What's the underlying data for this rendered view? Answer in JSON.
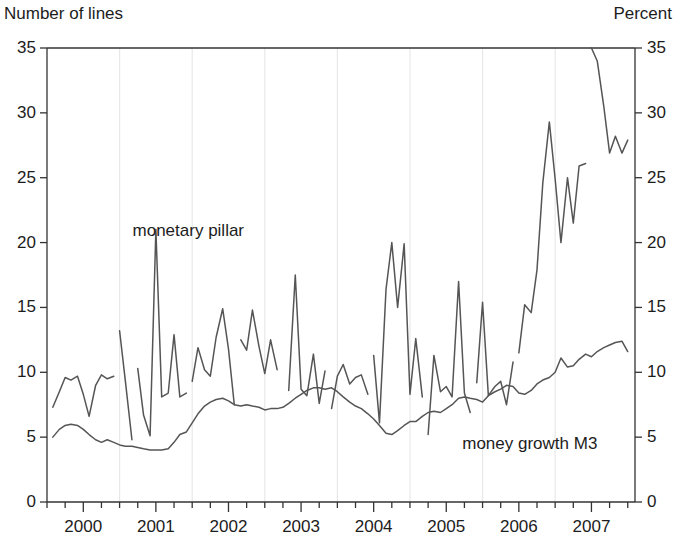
{
  "chart_data": {
    "type": "line",
    "title": "",
    "subtitle": "",
    "left_axis_title": "Number of lines",
    "right_axis_title": "Percent",
    "xlabel": "",
    "ylabel": "Number of lines",
    "ylabel_right": "Percent",
    "ylim": [
      0,
      35
    ],
    "y_ticks": [
      0,
      5,
      10,
      15,
      20,
      25,
      30,
      35
    ],
    "y_ticks_right": [
      0,
      5,
      10,
      15,
      20,
      25,
      30,
      35
    ],
    "xlim": [
      1999.5,
      2007.6
    ],
    "x_tick_labels": [
      "2000",
      "2001",
      "2002",
      "2003",
      "2004",
      "2005",
      "2006",
      "2007"
    ],
    "x_tick_positions": [
      2000.0,
      2001.0,
      2002.0,
      2003.0,
      2004.0,
      2005.0,
      2006.0,
      2007.0
    ],
    "x_minor_tick_interval": 0.25,
    "grid": "vertical-only-faint",
    "gridline_positions": [
      2000.5,
      2001.5,
      2002.5,
      2003.5,
      2004.5,
      2005.5,
      2006.5
    ],
    "legend": "inline-annotations",
    "line_color": "#555555",
    "axis_color": "#333333",
    "gridline_color": "#e8e8e8",
    "annotations": [
      {
        "text": "monetary pillar",
        "x": 2001.45,
        "y": 20.9
      },
      {
        "text": "money growth M3",
        "x": 2006.15,
        "y": 4.5
      }
    ],
    "series": [
      {
        "name": "monetary pillar",
        "axis": "left",
        "units": "number of lines",
        "segments": [
          {
            "x": [
              1999.58,
              1999.67,
              1999.75,
              1999.83,
              1999.92,
              2000.0,
              2000.08,
              2000.17,
              2000.25,
              2000.33,
              2000.42
            ],
            "y": [
              7.3,
              8.5,
              9.6,
              9.4,
              9.7,
              8.3,
              6.6,
              9.0,
              9.8,
              9.5,
              9.7
            ]
          },
          {
            "x": [
              2000.5,
              2000.58,
              2000.67
            ],
            "y": [
              13.2,
              9.3,
              4.8
            ]
          },
          {
            "x": [
              2000.75,
              2000.83,
              2000.92,
              2001.0,
              2001.08,
              2001.17,
              2001.25,
              2001.33,
              2001.42
            ],
            "y": [
              10.3,
              6.7,
              5.1,
              21.0,
              8.1,
              8.4,
              12.9,
              8.1,
              8.4
            ]
          },
          {
            "x": [
              2001.5,
              2001.58,
              2001.67,
              2001.75,
              2001.83,
              2001.92,
              2002.0,
              2002.08
            ],
            "y": [
              9.3,
              11.9,
              10.2,
              9.7,
              12.7,
              14.9,
              11.8,
              7.5
            ]
          },
          {
            "x": [
              2002.17,
              2002.25,
              2002.33,
              2002.42,
              2002.5,
              2002.58,
              2002.67
            ],
            "y": [
              12.5,
              11.7,
              14.8,
              12.0,
              9.9,
              12.5,
              10.2
            ]
          },
          {
            "x": [
              2002.83,
              2002.92,
              2003.0,
              2003.08,
              2003.17,
              2003.25,
              2003.33
            ],
            "y": [
              8.6,
              17.5,
              8.7,
              8.2,
              11.4,
              7.6,
              10.1
            ]
          },
          {
            "x": [
              2003.42,
              2003.5,
              2003.58,
              2003.67,
              2003.75,
              2003.83,
              2003.92
            ],
            "y": [
              7.2,
              9.7,
              10.6,
              9.1,
              9.6,
              9.8,
              8.3
            ]
          },
          {
            "x": [
              2004.0,
              2004.08,
              2004.17,
              2004.25,
              2004.33,
              2004.42,
              2004.5,
              2004.58,
              2004.67
            ],
            "y": [
              11.3,
              6.1,
              16.4,
              20.0,
              15.0,
              19.9,
              8.3,
              12.6,
              8.1
            ]
          },
          {
            "x": [
              2004.75,
              2004.83,
              2004.92,
              2005.0,
              2005.08,
              2005.17,
              2005.25,
              2005.33
            ],
            "y": [
              5.2,
              11.3,
              8.5,
              8.9,
              8.1,
              17.0,
              8.4,
              6.9
            ]
          },
          {
            "x": [
              2005.42,
              2005.5,
              2005.58,
              2005.67,
              2005.75,
              2005.83,
              2005.92
            ],
            "y": [
              9.2,
              15.4,
              8.2,
              8.9,
              9.3,
              7.5,
              10.8
            ]
          },
          {
            "x": [
              2006.0,
              2006.08,
              2006.17,
              2006.25,
              2006.33,
              2006.42,
              2006.5,
              2006.58,
              2006.67,
              2006.75,
              2006.83,
              2006.92
            ],
            "y": [
              11.5,
              15.2,
              14.6,
              17.9,
              24.6,
              29.3,
              24.9,
              20.0,
              25.0,
              21.5,
              25.9,
              26.1
            ]
          },
          {
            "x": [
              2007.0,
              2007.08,
              2007.17,
              2007.25,
              2007.33,
              2007.42,
              2007.5
            ],
            "y": [
              35.0,
              34.0,
              30.5,
              26.9,
              28.2,
              26.9,
              27.9
            ]
          }
        ]
      },
      {
        "name": "money growth M3",
        "axis": "right",
        "units": "percent",
        "x": [
          1999.58,
          1999.67,
          1999.75,
          1999.83,
          1999.92,
          2000.0,
          2000.08,
          2000.17,
          2000.25,
          2000.33,
          2000.42,
          2000.5,
          2000.58,
          2000.67,
          2000.75,
          2000.83,
          2000.92,
          2001.0,
          2001.08,
          2001.17,
          2001.25,
          2001.33,
          2001.42,
          2001.5,
          2001.58,
          2001.67,
          2001.75,
          2001.83,
          2001.92,
          2002.0,
          2002.08,
          2002.17,
          2002.25,
          2002.33,
          2002.42,
          2002.5,
          2002.58,
          2002.67,
          2002.75,
          2002.83,
          2002.92,
          2003.0,
          2003.08,
          2003.17,
          2003.25,
          2003.33,
          2003.42,
          2003.5,
          2003.58,
          2003.67,
          2003.75,
          2003.83,
          2003.92,
          2004.0,
          2004.08,
          2004.17,
          2004.25,
          2004.33,
          2004.42,
          2004.5,
          2004.58,
          2004.67,
          2004.75,
          2004.83,
          2004.92,
          2005.0,
          2005.08,
          2005.17,
          2005.25,
          2005.33,
          2005.42,
          2005.5,
          2005.58,
          2005.67,
          2005.75,
          2005.83,
          2005.92,
          2006.0,
          2006.08,
          2006.17,
          2006.25,
          2006.33,
          2006.42,
          2006.5,
          2006.58,
          2006.67,
          2006.75,
          2006.83,
          2006.92,
          2007.0,
          2007.08,
          2007.17,
          2007.25,
          2007.33,
          2007.42,
          2007.5
        ],
        "y": [
          5.0,
          5.6,
          5.9,
          6.0,
          5.9,
          5.6,
          5.2,
          4.8,
          4.6,
          4.8,
          4.6,
          4.4,
          4.3,
          4.3,
          4.2,
          4.1,
          4.0,
          4.0,
          4.0,
          4.1,
          4.6,
          5.2,
          5.4,
          6.1,
          6.8,
          7.4,
          7.7,
          7.9,
          8.0,
          7.8,
          7.5,
          7.4,
          7.5,
          7.4,
          7.3,
          7.1,
          7.2,
          7.2,
          7.3,
          7.6,
          8.0,
          8.3,
          8.6,
          8.8,
          8.8,
          8.7,
          8.8,
          8.5,
          8.1,
          7.7,
          7.4,
          7.2,
          6.8,
          6.4,
          5.9,
          5.3,
          5.2,
          5.5,
          5.9,
          6.2,
          6.2,
          6.6,
          6.9,
          7.0,
          6.9,
          7.2,
          7.5,
          8.0,
          8.1,
          8.0,
          7.9,
          7.7,
          8.2,
          8.5,
          8.7,
          9.0,
          8.9,
          8.4,
          8.3,
          8.6,
          9.1,
          9.4,
          9.6,
          10.0,
          11.1,
          10.4,
          10.5,
          11.0,
          11.4,
          11.2,
          11.6,
          11.9,
          12.1,
          12.3,
          12.4,
          11.6
        ]
      }
    ]
  }
}
